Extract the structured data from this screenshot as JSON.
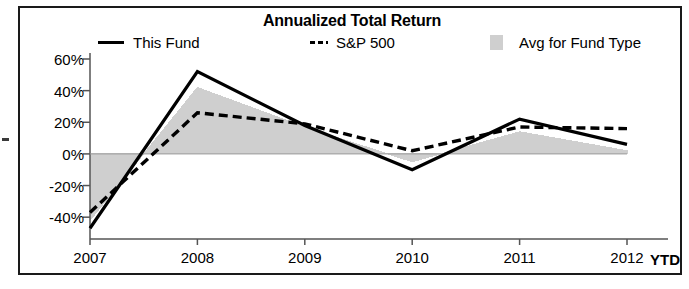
{
  "chart_data": {
    "type": "line",
    "title": "Annualized Total Return",
    "xlabel": "",
    "ylabel": "",
    "categories": [
      "2007",
      "2008",
      "2009",
      "2010",
      "2011",
      "2012"
    ],
    "x_axis_note": "YTD",
    "ylim": [
      -50,
      60
    ],
    "ytick_values": [
      60,
      40,
      20,
      0,
      -20,
      -40
    ],
    "ytick_labels": [
      "60%",
      "40%",
      "20%",
      "0%",
      "-20%",
      "-40%"
    ],
    "grid": false,
    "legend_position": "top",
    "series": [
      {
        "name": "This Fund",
        "style": "solid-line",
        "color": "#000000",
        "values": [
          -47,
          52,
          18,
          -10,
          22,
          6
        ]
      },
      {
        "name": "S&P 500",
        "style": "dashed-line",
        "color": "#000000",
        "values": [
          -37,
          26,
          19,
          2,
          17,
          16
        ]
      },
      {
        "name": "Avg for Fund Type",
        "style": "filled-area",
        "color": "#cfcfcf",
        "values": [
          -42,
          42,
          17,
          -5,
          14,
          2
        ]
      }
    ]
  },
  "legend": {
    "items": [
      {
        "label": "This Fund",
        "marker": "solid-line-marker"
      },
      {
        "label": "S&P 500",
        "marker": "dashed-line-marker"
      },
      {
        "label": "Avg for Fund Type",
        "marker": "area-swatch-marker"
      }
    ]
  }
}
